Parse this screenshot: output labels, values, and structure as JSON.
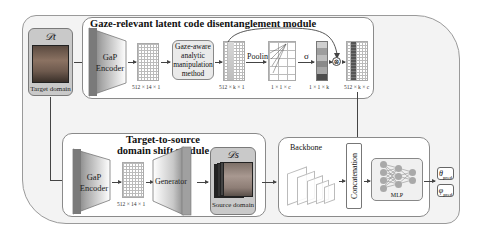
{
  "gaze_module": {
    "title": "Gaze-relevant latent code disentanglement module",
    "target_domain": {
      "symbol": "𝒟t",
      "label": "Target domain"
    },
    "encoder": {
      "line1": "GaP",
      "line2": "Encoder"
    },
    "latent_dim": "512 × 14 × 1",
    "manipulation": {
      "line1": "Gaze-aware",
      "line2": "analytic",
      "line3": "manipulation",
      "line4": "method"
    },
    "selected_dim": "512 × k × 1",
    "pooling_label": "Pooling",
    "pooled_dim": "1 × 1 × c",
    "sigma_label": "σ",
    "weight_dim": "1 × 1 × k",
    "multiply_symbol": "⊗",
    "output_dim": "512 × k × c"
  },
  "shift_module": {
    "title_line1": "Target-to-source",
    "title_line2": "domain shift module",
    "encoder": {
      "line1": "GaP",
      "line2": "Encoder"
    },
    "latent_dim": "512 × 14 × 1",
    "generator_label": "Generator",
    "source_domain": {
      "symbol": "𝒟s",
      "label": "Source domain"
    }
  },
  "prediction": {
    "backbone_label": "Backbone",
    "concat_label": "Concatenation",
    "mlp_label": "MLP",
    "outputs": [
      {
        "symbol": "θ",
        "sub": "pred"
      },
      {
        "symbol": "φ",
        "sub": "pred"
      }
    ]
  },
  "colors": {
    "frame_bg": "#f3f3f3",
    "module_bg": "#ffffff",
    "domain_box_bg": "#c9c9c9",
    "encoder_dark": "#7a7a7a",
    "line": "#444444"
  }
}
